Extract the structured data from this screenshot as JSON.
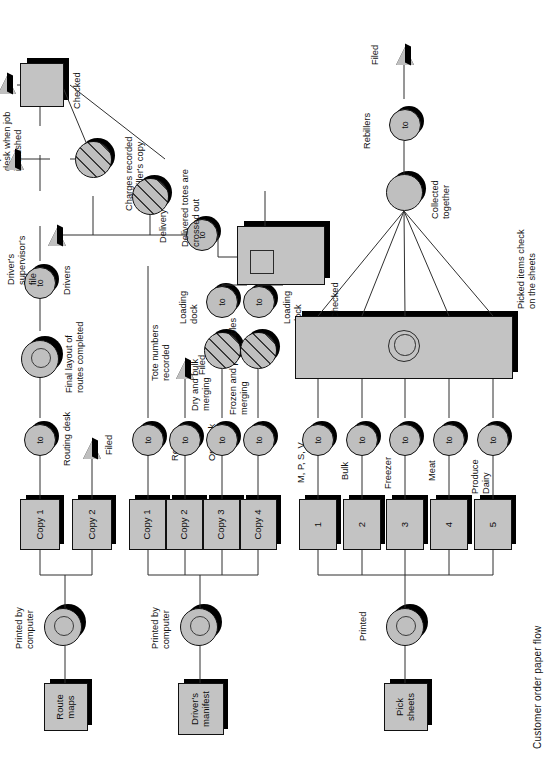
{
  "diagram": {
    "title": "Customer order paper flow",
    "type": "document-flowchart",
    "orientation": "rotated-90-ccw",
    "colors": {
      "shape_fill": "#c3c3c3",
      "circle_fill": "#bfbfbf",
      "shadow": "#000000",
      "line": "#2f2f2f",
      "text": "#101010",
      "background": "#ffffff"
    }
  },
  "streams": [
    {
      "id": "route-maps",
      "source_label": "Route\nmaps",
      "process_label": "Printed by\ncomputer",
      "copies": [
        "Copy 1",
        "Copy 2"
      ]
    },
    {
      "id": "drivers-manifest",
      "source_label": "Driver's\nmanifest",
      "process_label": "Printed by\ncomputer",
      "copies": [
        "Copy 1",
        "Copy 2",
        "Copy 3",
        "Copy 4"
      ]
    },
    {
      "id": "pick-sheets",
      "source_label": "Pick\nsheets",
      "process_label": "Printed",
      "copies": [
        "1",
        "2",
        "3",
        "4",
        "5"
      ]
    }
  ],
  "operation_symbol": "to",
  "destinations": {
    "route_copy1": "Routing desk",
    "route_copy2": "Filed",
    "manifest_copy1": "Rebiller",
    "manifest_copy2": "Op. desk",
    "manifest_copy2_note": "Filed",
    "manifest_copy3": "Dry and bulk\nmerging",
    "manifest_copy4": "Frozen and perishables\nmerging",
    "pick1": "M, P, S, V",
    "pick2": "Bulk",
    "pick3": "Freezer",
    "pick4": "Meat",
    "pick5": "Produce\nDairy"
  },
  "annotations": {
    "final_layout": "Final layout of\nroutes completed",
    "drivers": "Drivers",
    "checked_top": "Checked",
    "filed_supervisor": "Filed at driver's\nsupervisor's\ndesk when job\nis finished",
    "charges_recorded": "Charges recorded\non rebiller's copy",
    "file": "File",
    "drivers_supervisor_file": "Driver's\nsupervisor's\nfile",
    "delivered_totes": "Delivered totes are\ncrossed out",
    "delivery": "Delivery",
    "tote_numbers": "Tote numbers\nrecorded",
    "loading_dock_a": "Loading\ndock",
    "loading_dock_b": "Loading\ndock",
    "checked_dock": "Checked",
    "picked_items": "Picked items check\non the sheets",
    "collected_together": "Collected\ntogether",
    "rebillers": "Rebillers",
    "filed_right": "Filed"
  },
  "legend_symbols": [
    {
      "name": "document-box",
      "meaning": "document / form copy"
    },
    {
      "name": "operation-circle",
      "meaning": "operation ('to')"
    },
    {
      "name": "hatched-circle",
      "meaning": "recording / annotation operation"
    },
    {
      "name": "double-ring-circle",
      "meaning": "machine print operation"
    },
    {
      "name": "flag-triangle",
      "meaning": "file / storage"
    },
    {
      "name": "panel-rect",
      "meaning": "inspection / check station"
    }
  ]
}
